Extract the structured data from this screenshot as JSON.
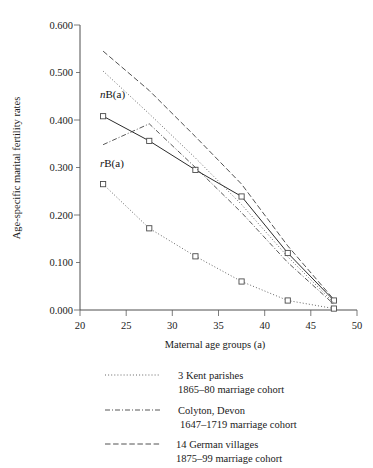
{
  "chart_data": {
    "type": "line",
    "title": "",
    "xlabel": "Maternal age groups  (a)",
    "ylabel": "Age-specific marital fertility rates",
    "xlim": [
      20,
      50
    ],
    "ylim": [
      0.0,
      0.6
    ],
    "xticks": [
      "20",
      "25",
      "30",
      "35",
      "40",
      "45",
      "50"
    ],
    "xtick_values": [
      20,
      25,
      30,
      35,
      40,
      45,
      50
    ],
    "yticks": [
      "0.000",
      "0.100",
      "0.200",
      "0.300",
      "0.400",
      "0.500",
      "0.600"
    ],
    "ytick_values": [
      0.0,
      0.1,
      0.2,
      0.3,
      0.4,
      0.5,
      0.6
    ],
    "grid": false,
    "legend_position": "below-plot",
    "x": [
      22.5,
      27.5,
      32.5,
      37.5,
      42.5,
      47.5
    ],
    "series": [
      {
        "name": "nB(a)",
        "label_html": "<tspan class=\"it\">n</tspan>B(a)",
        "style": "solid",
        "markers": "square",
        "in_plot_label": "nB(a)",
        "values": [
          0.408,
          0.356,
          0.295,
          0.239,
          0.12,
          0.02
        ]
      },
      {
        "name": "rB(a)",
        "label_html": "<tspan class=\"it\">r</tspan>B(a)",
        "style": "dotted",
        "markers": "square",
        "in_plot_label": "rB(a)",
        "values": [
          0.265,
          0.172,
          0.113,
          0.06,
          0.02,
          0.003
        ]
      },
      {
        "name": "3 Kent parishes",
        "style": "dotted",
        "markers": "none",
        "values": [
          0.503,
          0.413,
          0.32,
          0.222,
          0.112,
          0.015
        ]
      },
      {
        "name": "Colyton, Devon",
        "style": "dash-dot",
        "markers": "none",
        "values": [
          0.348,
          0.392,
          0.3,
          0.205,
          0.1,
          0.012
        ]
      },
      {
        "name": "14 German villages",
        "style": "dashed",
        "markers": "none",
        "values": [
          0.545,
          0.462,
          0.365,
          0.265,
          0.135,
          0.022
        ]
      }
    ],
    "annotations": [
      {
        "text": "nB(a)",
        "x": 23.0,
        "y": 0.445
      },
      {
        "text": "rB(a)",
        "x": 23.0,
        "y": 0.3
      }
    ]
  },
  "legend": {
    "entries": [
      {
        "style": "dotted",
        "line1": "3 Kent parishes",
        "line2": "1865–80 marriage cohort"
      },
      {
        "style": "dash-dot",
        "line1": "Colyton, Devon",
        "line2": "1647–1719 marriage cohort"
      },
      {
        "style": "dashed",
        "line1": "14 German villages",
        "line2": "1875–99 marriage cohort"
      }
    ]
  },
  "plot_labels": {
    "n_prefix": "n",
    "n_rest": "B(a)",
    "r_prefix": "r",
    "r_rest": "B(a)"
  }
}
